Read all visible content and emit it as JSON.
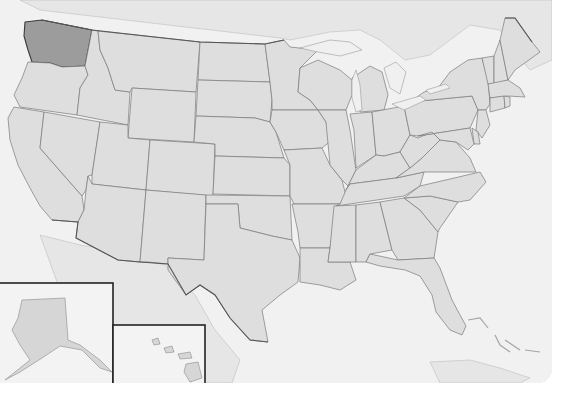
{
  "map": {
    "subject": "United States",
    "highlighted_state": "Washington",
    "style": "grayscale shaded relief",
    "colors": {
      "highlight_fill": "#9c9c9c",
      "state_fill": "#dedede",
      "ocean": "#f1f1f1",
      "border": "#7a7a7a"
    },
    "insets": [
      {
        "name": "Alaska"
      },
      {
        "name": "Hawaii"
      }
    ],
    "states": [
      "Washington",
      "Oregon",
      "California",
      "Idaho",
      "Nevada",
      "Montana",
      "Wyoming",
      "Utah",
      "Arizona",
      "Colorado",
      "New Mexico",
      "North Dakota",
      "South Dakota",
      "Nebraska",
      "Kansas",
      "Oklahoma",
      "Texas",
      "Minnesota",
      "Iowa",
      "Missouri",
      "Arkansas",
      "Louisiana",
      "Wisconsin",
      "Illinois",
      "Michigan",
      "Indiana",
      "Ohio",
      "Kentucky",
      "Tennessee",
      "Mississippi",
      "Alabama",
      "Georgia",
      "Florida",
      "South Carolina",
      "North Carolina",
      "Virginia",
      "West Virginia",
      "Pennsylvania",
      "New York",
      "Vermont",
      "New Hampshire",
      "Maine",
      "Massachusetts",
      "Connecticut",
      "Rhode Island",
      "New Jersey",
      "Delaware",
      "Maryland"
    ]
  }
}
